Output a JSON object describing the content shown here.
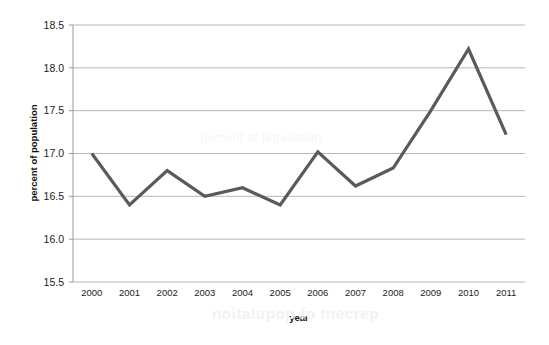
{
  "chart_data": {
    "type": "line",
    "title": "",
    "xlabel": "year",
    "ylabel": "percent of population",
    "categories": [
      "2000",
      "2001",
      "2002",
      "2003",
      "2004",
      "2005",
      "2006",
      "2007",
      "2008",
      "2009",
      "2010",
      "2011"
    ],
    "values": [
      17.0,
      16.4,
      16.8,
      16.5,
      16.6,
      16.4,
      17.02,
      16.62,
      16.83,
      17.5,
      18.22,
      17.22
    ],
    "series": [
      {
        "name": "percent of population",
        "values": [
          17.0,
          16.4,
          16.8,
          16.5,
          16.6,
          16.4,
          17.02,
          16.62,
          16.83,
          17.5,
          18.22,
          17.22
        ]
      }
    ],
    "ylim": [
      15.5,
      18.5
    ],
    "ytick_labels": [
      "18.5",
      "18.0",
      "17.5",
      "17.0",
      "16.5",
      "16.0",
      "15.5"
    ],
    "ytick_values": [
      18.5,
      18.0,
      17.5,
      17.0,
      16.5,
      16.0,
      15.5
    ],
    "xtick_labels": [
      "2000",
      "2001",
      "2002",
      "2003",
      "2004",
      "2005",
      "2006",
      "2007",
      "2008",
      "2009",
      "2010",
      "2011"
    ],
    "grid": "horizontal",
    "legend": "none",
    "line_color": "#5a5a5a",
    "gridline_color": "#b7b7b7",
    "axis_color": "#9a9a9a",
    "background_color": "#ffffff"
  },
  "artifacts": {
    "bleed_text_bottom": "noitalupop fo tnecrep",
    "bleed_text_middle": "percent of population"
  }
}
